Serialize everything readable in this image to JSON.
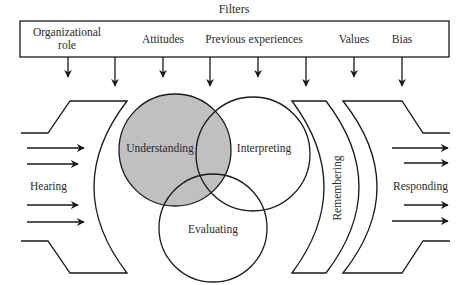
{
  "title": "Filters",
  "filters": [
    {
      "label_line1": "Organizational",
      "label_line2": "role"
    },
    {
      "label_line1": "Attitudes"
    },
    {
      "label_line1": "Previous experiences"
    },
    {
      "label_line1": "Values"
    },
    {
      "label_line1": "Bias"
    }
  ],
  "stages": {
    "hearing": "Hearing",
    "understanding": "Understanding",
    "interpreting": "Interpreting",
    "evaluating": "Evaluating",
    "remembering": "Remembering",
    "responding": "Responding"
  },
  "colors": {
    "line": "#1a1a1a",
    "understanding_fill": "#c0c0c0",
    "background": "#ffffff"
  }
}
